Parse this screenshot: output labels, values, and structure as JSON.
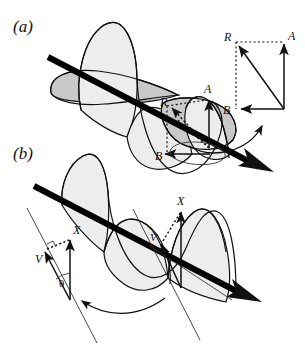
{
  "figure": {
    "width": 305,
    "height": 364,
    "background": "#ffffff"
  },
  "panels": [
    {
      "id": "a",
      "label": "(a)",
      "description": "Helical wave propagating along a thick diagonal axis with amplitude vectors A, B and resultant R shown at one cross-section, plus an inset vector parallelogram."
    },
    {
      "id": "b",
      "label": "(b)",
      "description": "Helical wave along a thick diagonal axis with displacement vector X and velocity vector V separated by angle theta, shown at two positions along the wave."
    }
  ],
  "panel_a": {
    "label": "(a)",
    "vectors": [
      {
        "name": "A",
        "label": "A",
        "style": "solid",
        "direction": "up",
        "role": "vertical-component"
      },
      {
        "name": "B",
        "label": "B",
        "style": "solid",
        "direction": "left",
        "role": "horizontal-component"
      },
      {
        "name": "R",
        "label": "R",
        "style": "dotted",
        "direction": "up-left",
        "role": "resultant"
      }
    ],
    "inset": {
      "name": "vector-parallelogram",
      "corners": [
        {
          "label": "R",
          "position": "top-left"
        },
        {
          "label": "A",
          "position": "top-right"
        },
        {
          "label": "B",
          "position": "bottom-left"
        }
      ],
      "origin": "bottom-right",
      "solid_edges": [
        "origin-to-A",
        "origin-to-B",
        "origin-to-R"
      ],
      "dotted_edges": [
        "R-to-A",
        "R-to-B"
      ]
    },
    "callout": {
      "name": "inset-callout-arrow",
      "from": "helix-cross-section",
      "to": "inset-diagram"
    }
  },
  "panel_b": {
    "label": "(b)",
    "vectors": [
      {
        "name": "X-left",
        "label": "X",
        "style": "solid",
        "direction": "up",
        "role": "displacement"
      },
      {
        "name": "V-left",
        "label": "V",
        "style": "solid",
        "direction": "up-left",
        "role": "velocity"
      },
      {
        "name": "X-right",
        "label": "X",
        "style": "solid",
        "direction": "up",
        "role": "displacement"
      },
      {
        "name": "V-right",
        "label": "V",
        "style": "solid",
        "direction": "up-left",
        "role": "velocity"
      }
    ],
    "angle": {
      "name": "theta-angle",
      "label": "θ",
      "between": [
        "X",
        "V"
      ]
    },
    "right_angle_marker": {
      "name": "right-angle-mark",
      "label": ""
    },
    "callout": {
      "name": "detail-callout-arrow",
      "from": "wave-position",
      "to": "vector-triangle"
    }
  },
  "colors": {
    "ink": "#111111",
    "axis": "#000000",
    "lobe_light": "#ededed",
    "lobe_mid": "#c9c9c9",
    "lobe_front": "#e3e3e3",
    "background": "#ffffff",
    "thin_line": "#333333"
  }
}
